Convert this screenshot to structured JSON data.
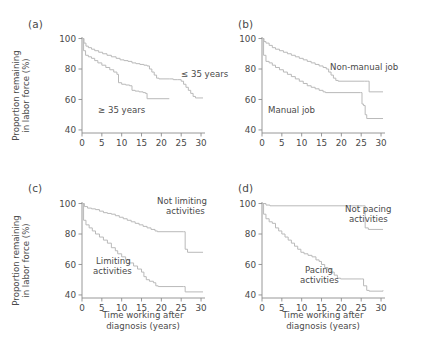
{
  "figure": {
    "axis_color": "#8c8c8c",
    "curve_color": "#b9b9b9",
    "text_color": "#4a4a4a",
    "background": "#ffffff"
  },
  "axes": {
    "xlabel_line1": "Time working after",
    "xlabel_line2": "diagnosis (years)",
    "ylabel_line1": "Proportion remaining",
    "ylabel_line2": "in labor force (%)",
    "xticks": [
      0,
      5,
      10,
      15,
      20,
      25,
      30
    ],
    "yticks": [
      40,
      60,
      80,
      100
    ],
    "xlim": [
      0,
      31
    ],
    "ylim": [
      38,
      101
    ]
  },
  "panels": [
    {
      "letter": "(a)",
      "name": "age-at-diagnosis",
      "labels": [
        {
          "text": "≤ 35 years",
          "x": 181,
          "y": 69
        },
        {
          "text": "≥ 35 years",
          "x": 98,
          "y": 105
        }
      ],
      "series": [
        {
          "name": "≤ 35 years",
          "points": [
            [
              0,
              100
            ],
            [
              0.5,
              97
            ],
            [
              1,
              95
            ],
            [
              1.6,
              94
            ],
            [
              2.4,
              93
            ],
            [
              3.2,
              92
            ],
            [
              4.2,
              91
            ],
            [
              5.2,
              90
            ],
            [
              6.3,
              89
            ],
            [
              7.4,
              88
            ],
            [
              8.6,
              87
            ],
            [
              9.6,
              86
            ],
            [
              10.6,
              85.5
            ],
            [
              11.6,
              85
            ],
            [
              12.6,
              84
            ],
            [
              13.6,
              83.5
            ],
            [
              14.6,
              83
            ],
            [
              15.6,
              82.5
            ],
            [
              16.4,
              82
            ],
            [
              17,
              80
            ],
            [
              17.6,
              78
            ],
            [
              18.2,
              76
            ],
            [
              18.8,
              74
            ],
            [
              19.4,
              73.5
            ],
            [
              22,
              73.5
            ],
            [
              23,
              73
            ],
            [
              24,
              73
            ],
            [
              25,
              72
            ],
            [
              25.6,
              70
            ],
            [
              26.2,
              68
            ],
            [
              26.8,
              66
            ],
            [
              27.4,
              64
            ],
            [
              28,
              62
            ],
            [
              28.6,
              61
            ],
            [
              30.5,
              61
            ]
          ]
        },
        {
          "name": "≥ 35 years",
          "points": [
            [
              0,
              100
            ],
            [
              0.4,
              92
            ],
            [
              0.9,
              89
            ],
            [
              1.6,
              88
            ],
            [
              2.4,
              87
            ],
            [
              3.2,
              85.5
            ],
            [
              4,
              84
            ],
            [
              5,
              82.5
            ],
            [
              6,
              81
            ],
            [
              7,
              79.5
            ],
            [
              8,
              78
            ],
            [
              8.8,
              76.5
            ],
            [
              9.2,
              71
            ],
            [
              10,
              70
            ],
            [
              11,
              69.5
            ],
            [
              12,
              69
            ],
            [
              12.6,
              66
            ],
            [
              13.4,
              65.5
            ],
            [
              14.4,
              65
            ],
            [
              15.4,
              64.5
            ],
            [
              16,
              64
            ],
            [
              16.4,
              60.5
            ],
            [
              22,
              60.5
            ]
          ]
        }
      ]
    },
    {
      "letter": "(b)",
      "name": "job-type",
      "labels": [
        {
          "text": "Non-manual job",
          "x": 330,
          "y": 62
        },
        {
          "text": "Manual job",
          "x": 268,
          "y": 105
        }
      ],
      "series": [
        {
          "name": "Non-manual job",
          "points": [
            [
              0,
              100
            ],
            [
              0.5,
              98
            ],
            [
              1,
              97
            ],
            [
              1.8,
              95.5
            ],
            [
              2.6,
              94
            ],
            [
              3.4,
              93
            ],
            [
              4.4,
              92
            ],
            [
              5.4,
              91
            ],
            [
              6.4,
              90
            ],
            [
              7.4,
              89
            ],
            [
              8.4,
              88
            ],
            [
              9.4,
              87
            ],
            [
              10.4,
              86
            ],
            [
              11.4,
              85
            ],
            [
              12.4,
              84
            ],
            [
              13.4,
              83
            ],
            [
              14.4,
              82
            ],
            [
              15.4,
              81
            ],
            [
              16.2,
              80
            ],
            [
              16.8,
              78
            ],
            [
              17.4,
              76
            ],
            [
              18,
              74
            ],
            [
              18.6,
              72.5
            ],
            [
              19.2,
              72
            ],
            [
              25.8,
              72
            ],
            [
              26.6,
              72
            ],
            [
              27,
              65
            ],
            [
              30.5,
              65
            ]
          ]
        },
        {
          "name": "Manual job",
          "points": [
            [
              0,
              100
            ],
            [
              0.4,
              89
            ],
            [
              1,
              85
            ],
            [
              1.8,
              84
            ],
            [
              2.6,
              82.5
            ],
            [
              3.4,
              81
            ],
            [
              4.4,
              79.5
            ],
            [
              5.4,
              78
            ],
            [
              6.4,
              76.5
            ],
            [
              7.4,
              75
            ],
            [
              8.4,
              73.5
            ],
            [
              9.4,
              72
            ],
            [
              10.4,
              70.5
            ],
            [
              11.4,
              69
            ],
            [
              12.4,
              68
            ],
            [
              13.4,
              67
            ],
            [
              14.4,
              66
            ],
            [
              15.4,
              65
            ],
            [
              16,
              64.5
            ],
            [
              24.8,
              64.5
            ],
            [
              25.2,
              57
            ],
            [
              25.6,
              56
            ],
            [
              26,
              50
            ],
            [
              26.4,
              47.5
            ],
            [
              30.5,
              47.5
            ]
          ]
        }
      ]
    },
    {
      "letter": "(c)",
      "name": "limiting-activities",
      "labels": [
        {
          "text": "Not limiting",
          "x": 157,
          "y": 196
        },
        {
          "text": "activities",
          "x": 166,
          "y": 206
        },
        {
          "text": "Limiting",
          "x": 96,
          "y": 256
        },
        {
          "text": "activities",
          "x": 93,
          "y": 266
        }
      ],
      "series": [
        {
          "name": "Not limiting activities",
          "points": [
            [
              0,
              100
            ],
            [
              0.6,
              98
            ],
            [
              1.4,
              97
            ],
            [
              2.4,
              96.5
            ],
            [
              3.4,
              96
            ],
            [
              4.4,
              95
            ],
            [
              5.4,
              94
            ],
            [
              6.4,
              93.5
            ],
            [
              7.4,
              93
            ],
            [
              8.4,
              92
            ],
            [
              9.4,
              91
            ],
            [
              10.4,
              90
            ],
            [
              11.4,
              89
            ],
            [
              12.4,
              88
            ],
            [
              13.4,
              87
            ],
            [
              14.4,
              86
            ],
            [
              15.4,
              85
            ],
            [
              16.4,
              84
            ],
            [
              17.4,
              83
            ],
            [
              18.4,
              82
            ],
            [
              19,
              81.5
            ],
            [
              25.6,
              81.5
            ],
            [
              26,
              70
            ],
            [
              26.6,
              68
            ],
            [
              30.5,
              68
            ]
          ]
        },
        {
          "name": "Limiting activities",
          "points": [
            [
              0,
              100
            ],
            [
              0.4,
              89
            ],
            [
              1,
              86
            ],
            [
              1.8,
              84
            ],
            [
              2.6,
              82
            ],
            [
              3.4,
              80
            ],
            [
              4.4,
              78
            ],
            [
              5.4,
              76
            ],
            [
              6.4,
              74
            ],
            [
              7.4,
              71
            ],
            [
              8.4,
              69
            ],
            [
              9,
              67
            ],
            [
              10,
              65
            ],
            [
              11,
              63
            ],
            [
              12,
              61
            ],
            [
              13,
              59
            ],
            [
              14,
              57
            ],
            [
              15,
              55
            ],
            [
              15.6,
              52
            ],
            [
              16.2,
              50
            ],
            [
              17,
              49
            ],
            [
              18,
              48
            ],
            [
              18.6,
              46
            ],
            [
              19.2,
              45.5
            ],
            [
              25.6,
              45.5
            ],
            [
              26,
              42
            ],
            [
              30.5,
              42
            ]
          ]
        }
      ]
    },
    {
      "letter": "(d)",
      "name": "pacing-activities",
      "labels": [
        {
          "text": "Not pacing",
          "x": 345,
          "y": 204
        },
        {
          "text": "activities",
          "x": 349,
          "y": 214
        }
      ],
      "series": [
        {
          "name": "Not pacing activities",
          "points": [
            [
              0,
              100
            ],
            [
              1,
              99
            ],
            [
              2,
              98.5
            ],
            [
              25.4,
              98.5
            ],
            [
              26,
              84
            ],
            [
              26.8,
              83
            ],
            [
              30.5,
              83
            ]
          ]
        },
        {
          "name": "Pacing activities",
          "points": [
            [
              0,
              100
            ],
            [
              0.4,
              93
            ],
            [
              1,
              90
            ],
            [
              1.8,
              88
            ],
            [
              2.6,
              87
            ],
            [
              3.4,
              84
            ],
            [
              4.2,
              82
            ],
            [
              5,
              80
            ],
            [
              5.8,
              78
            ],
            [
              6.6,
              76
            ],
            [
              7.4,
              74
            ],
            [
              8.2,
              72
            ],
            [
              9,
              70
            ],
            [
              9.8,
              68
            ],
            [
              10.6,
              67
            ],
            [
              11.6,
              66
            ],
            [
              12.6,
              65
            ],
            [
              13.6,
              63
            ],
            [
              14.4,
              62
            ],
            [
              15,
              60
            ],
            [
              15.8,
              58
            ],
            [
              16.6,
              57
            ],
            [
              17.4,
              55
            ],
            [
              18.2,
              53
            ],
            [
              19,
              51
            ],
            [
              19.8,
              50.5
            ],
            [
              25,
              50.5
            ],
            [
              25.6,
              46
            ],
            [
              26.4,
              43
            ],
            [
              27,
              42.5
            ],
            [
              30.5,
              43
            ]
          ]
        }
      ]
    }
  ],
  "label_positions": {
    "pacing_label": [
      {
        "text": "Pacing",
        "x": 305,
        "y": 265
      },
      {
        "text": "activities",
        "x": 300,
        "y": 275
      }
    ]
  }
}
